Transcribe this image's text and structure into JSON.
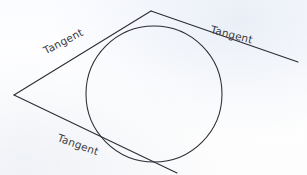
{
  "figure": {
    "background_color": "#fdfdff",
    "stroke_color": "#2b2b33",
    "text_color": "#3b3b42",
    "labels": {
      "upper_left": "Tangent",
      "right": "Tangent",
      "bottom_left": "Tangent"
    },
    "circle": {
      "center_x": 154,
      "center_y": 94,
      "radius": 68
    },
    "vertices": {
      "top_apex_x": 151,
      "top_apex_y": 11,
      "left_vertex_x": 14,
      "left_vertex_y": 95
    },
    "lines": [
      {
        "name": "upper-left-tangent",
        "x1": 14,
        "y1": 95,
        "x2": 151,
        "y2": 11
      },
      {
        "name": "right-tangent",
        "x1": 151,
        "y1": 11,
        "x2": 298,
        "y2": 62
      },
      {
        "name": "bottom-tangent",
        "x1": 14,
        "y1": 95,
        "x2": 177,
        "y2": 173
      }
    ]
  }
}
